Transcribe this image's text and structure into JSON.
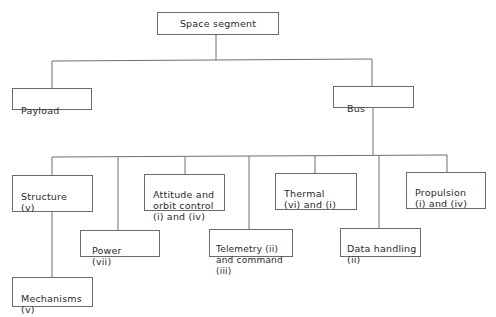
{
  "diagram": {
    "type": "hierarchy-tree",
    "root": {
      "label": "Space segment"
    },
    "level1": [
      {
        "id": "payload",
        "label": "Payload"
      },
      {
        "id": "bus",
        "label": "Bus"
      }
    ],
    "bus_children": [
      {
        "id": "structure",
        "label": "Structure\n(v)"
      },
      {
        "id": "power",
        "label": "Power\n(vii)"
      },
      {
        "id": "attitude",
        "label": "Attitude and\norbit control\n(i) and (iv)"
      },
      {
        "id": "telemetry",
        "label": "Telemetry (ii)\nand command (iii)"
      },
      {
        "id": "thermal",
        "label": "Thermal\n(vi) and (i)"
      },
      {
        "id": "data_handling",
        "label": "Data handling\n(ii)"
      },
      {
        "id": "propulsion",
        "label": "Propulsion\n(i) and (iv)"
      }
    ],
    "structure_children": [
      {
        "id": "mechanisms",
        "label": "Mechanisms\n(v)"
      }
    ]
  }
}
